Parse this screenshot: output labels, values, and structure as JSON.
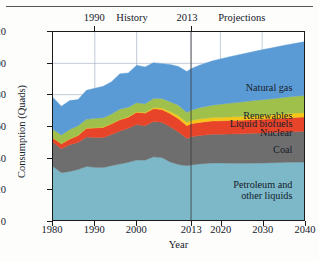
{
  "figure": {
    "y_axis_title": "Consumption (Quads)",
    "x_axis_title": "Year"
  },
  "era_labels": [
    {
      "name": "era-1990",
      "text": "1990",
      "x_year": 1990
    },
    {
      "name": "era-history",
      "text": "History",
      "x_year": 1999
    },
    {
      "name": "era-2013",
      "text": "2013",
      "x_year": 2012
    },
    {
      "name": "era-projections",
      "text": "Projections",
      "x_year": 2025
    }
  ],
  "axes": {
    "x_ticks": [
      1980,
      1990,
      2000,
      2013,
      2020,
      2030,
      2040
    ],
    "x_tick_labels": [
      "1980",
      "1990",
      "2000",
      "2013",
      "2020",
      "2030",
      "2040"
    ],
    "y_ticks": [
      0,
      20,
      40,
      60,
      80,
      100,
      120
    ],
    "y_tick_labels": [
      "0",
      "20",
      "40",
      "60",
      "80",
      "100",
      "120"
    ],
    "xlim": [
      1980,
      2040
    ],
    "ylim": [
      0,
      120
    ],
    "grid": true,
    "divider_year": 2013
  },
  "series_labels": [
    {
      "name": "label-natural-gas",
      "text": "Natural gas",
      "x_year": 2037,
      "y_value": 84
    },
    {
      "name": "label-renewables",
      "text": "Renewables",
      "x_year": 2037,
      "y_value": 66.5
    },
    {
      "name": "label-liquid-biofuels",
      "text": "Liquid biofuels",
      "x_year": 2037,
      "y_value": 61.0
    },
    {
      "name": "label-nuclear",
      "text": "Nuclear",
      "x_year": 2037,
      "y_value": 55.5
    },
    {
      "name": "label-coal",
      "text": "Coal",
      "x_year": 2037,
      "y_value": 45.0
    },
    {
      "name": "label-petroleum",
      "text": "Petroleum and\nother liquids",
      "x_year": 2037,
      "y_value": 23.0
    }
  ],
  "colors": {
    "petroleum": "#7cb8c8",
    "coal": "#6e6e6e",
    "nuclear": "#e8442a",
    "liquid_biofuels": "#f5c518",
    "renewables": "#9fc04a",
    "natural_gas": "#5b9bd5",
    "axis": "#1a1a1a",
    "grid": "#9aa7bd",
    "background": "#ffffff",
    "text": "#15202b"
  },
  "chart_data": {
    "type": "area",
    "title": "",
    "subtitle": "",
    "xlabel": "Year",
    "ylabel": "Consumption (Quads)",
    "xlim": [
      1980,
      2040
    ],
    "ylim": [
      0,
      120
    ],
    "grid": true,
    "legend": "in-plot right-aligned labels",
    "stacked": true,
    "annotations": [
      "1990",
      "History",
      "2013",
      "Projections"
    ],
    "x": [
      1980,
      1982,
      1984,
      1986,
      1988,
      1990,
      1992,
      1994,
      1996,
      1998,
      2000,
      2002,
      2004,
      2006,
      2008,
      2010,
      2012,
      2013,
      2015,
      2018,
      2020,
      2022,
      2025,
      2028,
      2030,
      2033,
      2036,
      2040
    ],
    "series": [
      {
        "name": "Petroleum and other liquids",
        "color": "#7cb8c8",
        "values": [
          34.2,
          30.2,
          31.0,
          32.2,
          34.2,
          33.6,
          33.5,
          34.7,
          35.8,
          36.8,
          38.3,
          38.2,
          40.3,
          39.9,
          37.1,
          35.4,
          34.7,
          35.1,
          35.8,
          36.4,
          36.4,
          36.3,
          36.2,
          36.3,
          36.4,
          36.6,
          36.8,
          37.0
        ]
      },
      {
        "name": "Coal",
        "color": "#6e6e6e",
        "values": [
          15.4,
          15.3,
          17.1,
          17.3,
          18.8,
          19.1,
          19.1,
          19.9,
          21.0,
          21.7,
          22.6,
          21.9,
          22.5,
          22.5,
          22.4,
          20.8,
          17.4,
          18.0,
          18.1,
          18.3,
          18.4,
          18.6,
          18.8,
          19.0,
          19.1,
          19.2,
          19.4,
          19.6
        ]
      },
      {
        "name": "Nuclear",
        "color": "#e8442a",
        "values": [
          2.7,
          3.1,
          3.6,
          4.5,
          5.6,
          6.1,
          6.5,
          6.8,
          7.2,
          7.1,
          7.9,
          8.1,
          8.2,
          8.2,
          8.4,
          8.4,
          8.1,
          8.3,
          8.4,
          8.5,
          8.5,
          8.6,
          8.7,
          8.8,
          8.8,
          8.9,
          9.0,
          9.1
        ]
      },
      {
        "name": "Liquid biofuels",
        "color": "#f5c518",
        "values": [
          0.0,
          0.1,
          0.1,
          0.1,
          0.1,
          0.1,
          0.2,
          0.2,
          0.2,
          0.3,
          0.3,
          0.4,
          0.6,
          0.9,
          1.4,
          1.9,
          2.0,
          2.1,
          2.2,
          2.2,
          2.3,
          2.3,
          2.4,
          2.5,
          2.5,
          2.6,
          2.7,
          2.8
        ]
      },
      {
        "name": "Renewables",
        "color": "#9fc04a",
        "values": [
          5.5,
          5.5,
          6.0,
          6.1,
          5.6,
          6.0,
          5.9,
          6.0,
          6.6,
          6.1,
          5.8,
          5.6,
          5.9,
          6.1,
          6.2,
          6.8,
          6.4,
          6.5,
          7.2,
          7.8,
          8.3,
          8.7,
          9.2,
          9.6,
          9.9,
          10.2,
          10.6,
          11.0
        ]
      },
      {
        "name": "Natural gas",
        "color": "#5b9bd5",
        "values": [
          20.4,
          18.4,
          18.4,
          16.7,
          18.5,
          19.2,
          20.1,
          20.7,
          22.6,
          21.9,
          23.8,
          23.5,
          22.9,
          22.2,
          23.8,
          24.7,
          26.2,
          26.6,
          27.1,
          28.3,
          28.9,
          29.6,
          30.5,
          31.4,
          32.0,
          32.7,
          33.4,
          34.2
        ]
      }
    ],
    "totals": [
      78.2,
      72.6,
      76.2,
      76.9,
      82.8,
      84.1,
      85.3,
      88.3,
      93.4,
      93.9,
      98.7,
      97.7,
      100.4,
      99.8,
      99.3,
      98.0,
      94.8,
      96.6,
      98.8,
      101.5,
      102.8,
      104.1,
      105.8,
      107.6,
      108.7,
      110.2,
      111.9,
      113.7
    ]
  }
}
